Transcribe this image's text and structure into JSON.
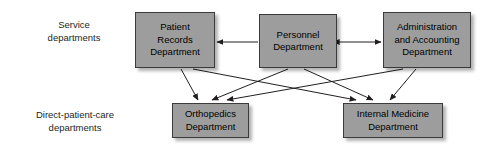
{
  "diagram": {
    "row_labels": [
      {
        "id": "service",
        "text": "Service\ndepartments"
      },
      {
        "id": "direct",
        "text": "Direct-patient-care\ndepartments"
      }
    ],
    "nodes": [
      {
        "id": "patient-records",
        "label": "Patient\nRecords\nDepartment",
        "fill": "#9d9d9d",
        "border": "#3b3b3b",
        "row": "service"
      },
      {
        "id": "personnel",
        "label": "Personnel\nDepartment",
        "fill": "#9d9d9d",
        "border": "#3b3b3b",
        "row": "service"
      },
      {
        "id": "administration",
        "label": "Administration\nand Accounting\nDepartment",
        "fill": "#9d9d9d",
        "border": "#3b3b3b",
        "row": "service"
      },
      {
        "id": "orthopedics",
        "label": "Orthopedics\nDepartment",
        "fill": "#9d9d9d",
        "border": "#3b3b3b",
        "row": "direct"
      },
      {
        "id": "internal-medicine",
        "label": "Internal Medicine\nDepartment",
        "fill": "#9d9d9d",
        "border": "#3b3b3b",
        "row": "direct"
      }
    ],
    "connectors": [
      {
        "id": "personnel-to-patient-records",
        "from": "personnel",
        "to": "patient-records",
        "style": "single-arrow",
        "orientation": "horizontal"
      },
      {
        "id": "personnel-administration",
        "from": "personnel",
        "to": "administration",
        "style": "double-arrow",
        "orientation": "horizontal"
      },
      {
        "id": "patient-records-to-orthopedics",
        "from": "patient-records",
        "to": "orthopedics",
        "style": "single-arrow",
        "orientation": "diagonal"
      },
      {
        "id": "patient-records-to-internal-medicine",
        "from": "patient-records",
        "to": "internal-medicine",
        "style": "single-arrow",
        "orientation": "diagonal"
      },
      {
        "id": "personnel-to-orthopedics",
        "from": "personnel",
        "to": "orthopedics",
        "style": "single-arrow",
        "orientation": "diagonal"
      },
      {
        "id": "personnel-to-internal-medicine",
        "from": "personnel",
        "to": "internal-medicine",
        "style": "single-arrow",
        "orientation": "diagonal"
      },
      {
        "id": "administration-to-orthopedics",
        "from": "administration",
        "to": "orthopedics",
        "style": "single-arrow",
        "orientation": "diagonal"
      },
      {
        "id": "administration-to-internal-medicine",
        "from": "administration",
        "to": "internal-medicine",
        "style": "single-arrow",
        "orientation": "diagonal"
      }
    ],
    "colors": {
      "node_fill": "#9d9d9d",
      "node_border": "#3b3b3b",
      "connector": "#231f20",
      "background": "#ffffff",
      "text": "#231f20"
    }
  }
}
